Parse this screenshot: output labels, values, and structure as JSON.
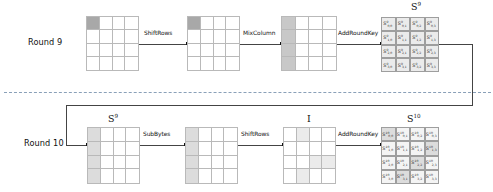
{
  "diagram": {
    "rows": [
      {
        "id": "round9",
        "label": "Round 9",
        "operations": [
          "ShiftRows",
          "MixColumn",
          "AddRoundKey"
        ],
        "output_state_label": "S",
        "output_state_superscript": "9"
      },
      {
        "id": "round10",
        "label": "Round 10",
        "input_state_label": "S",
        "input_state_superscript": "9",
        "operations": [
          "SubBytes",
          "ShiftRows",
          "AddRoundKey"
        ],
        "intermediate_label": "I",
        "output_state_label": "S",
        "output_state_superscript": "10"
      }
    ],
    "colors": {
      "grid_line": "#b9b9b9",
      "cell_border": "#9e9e9e",
      "connector": "#444444",
      "separator": "#8aa0b8",
      "shade_dark": "#a8a8a8",
      "shade_mid": "#c8c8c8",
      "shade_light": "#dcdcdc",
      "shade_pale": "#ebebeb"
    },
    "grids": {
      "r9_input": {
        "shading": [
          "dark",
          "",
          "",
          "",
          "",
          "",
          "",
          "",
          "",
          "",
          "",
          "",
          "",
          "",
          "",
          ""
        ]
      },
      "r9_shifted": {
        "shading": [
          "dark",
          "",
          "",
          "",
          "",
          "",
          "",
          "",
          "",
          "",
          "",
          "",
          "",
          "",
          "",
          ""
        ]
      },
      "r9_mixed": {
        "shading": [
          "mid",
          "",
          "",
          "",
          "mid",
          "",
          "",
          "",
          "mid",
          "",
          "",
          "",
          "mid",
          "",
          "",
          ""
        ]
      },
      "r10_input": {
        "shading": [
          "light",
          "",
          "",
          "",
          "light",
          "",
          "",
          "",
          "light",
          "",
          "",
          "",
          "light",
          "",
          "",
          ""
        ]
      },
      "r10_subbytes": {
        "shading": [
          "light",
          "",
          "",
          "",
          "light",
          "",
          "",
          "",
          "light",
          "",
          "",
          "",
          "light",
          "",
          "",
          ""
        ]
      },
      "r10_shiftrows_I": {
        "shading": [
          "",
          "pale",
          "",
          "",
          "",
          "",
          "",
          "",
          "",
          "",
          "pale",
          "pale",
          "",
          "pale",
          "",
          ""
        ]
      }
    },
    "state_s9": {
      "heading_base": "S",
      "heading_sup": "9",
      "cells": [
        {
          "base": "S",
          "sup": "9",
          "sub": "0,0"
        },
        {
          "base": "S",
          "sup": "9",
          "sub": "0,1"
        },
        {
          "base": "S",
          "sup": "9",
          "sub": "0,2"
        },
        {
          "base": "S",
          "sup": "9",
          "sub": "0,3"
        },
        {
          "base": "S",
          "sup": "9",
          "sub": "1,0"
        },
        {
          "base": "S",
          "sup": "9",
          "sub": "1,1"
        },
        {
          "base": "S",
          "sup": "9",
          "sub": "1,2"
        },
        {
          "base": "S",
          "sup": "9",
          "sub": "1,3"
        },
        {
          "base": "S",
          "sup": "9",
          "sub": "2,0"
        },
        {
          "base": "S",
          "sup": "9",
          "sub": "2,1"
        },
        {
          "base": "S",
          "sup": "9",
          "sub": "2,2"
        },
        {
          "base": "S",
          "sup": "9",
          "sub": "2,3"
        },
        {
          "base": "S",
          "sup": "9",
          "sub": "3,0"
        },
        {
          "base": "S",
          "sup": "9",
          "sub": "3,1"
        },
        {
          "base": "S",
          "sup": "9",
          "sub": "3,2"
        },
        {
          "base": "S",
          "sup": "9",
          "sub": "3,3"
        }
      ],
      "shading": [
        "pale",
        "pale",
        "pale",
        "pale",
        "pale",
        "pale",
        "pale",
        "pale",
        "pale",
        "pale",
        "pale",
        "pale",
        "pale",
        "pale",
        "pale",
        "pale"
      ]
    },
    "state_s10": {
      "heading_base": "S",
      "heading_sup": "10",
      "cells": [
        {
          "base": "S",
          "sup": "10",
          "sub": "0,0"
        },
        {
          "base": "S",
          "sup": "10",
          "sub": "0,1"
        },
        {
          "base": "S",
          "sup": "10",
          "sub": "0,2"
        },
        {
          "base": "S",
          "sup": "10",
          "sub": "0,3"
        },
        {
          "base": "S",
          "sup": "10",
          "sub": "1,0"
        },
        {
          "base": "S",
          "sup": "10",
          "sub": "1,1"
        },
        {
          "base": "S",
          "sup": "10",
          "sub": "1,2"
        },
        {
          "base": "S",
          "sup": "10",
          "sub": "1,3"
        },
        {
          "base": "S",
          "sup": "10",
          "sub": "2,0"
        },
        {
          "base": "S",
          "sup": "10",
          "sub": "2,1"
        },
        {
          "base": "S",
          "sup": "10",
          "sub": "2,2"
        },
        {
          "base": "S",
          "sup": "10",
          "sub": "2,3"
        },
        {
          "base": "S",
          "sup": "10",
          "sub": "3,0"
        },
        {
          "base": "S",
          "sup": "10",
          "sub": "3,1"
        },
        {
          "base": "S",
          "sup": "10",
          "sub": "3,2"
        },
        {
          "base": "S",
          "sup": "10",
          "sub": "3,3"
        }
      ],
      "shading": [
        "light",
        "",
        "",
        "",
        "",
        "",
        "",
        "light",
        "",
        "",
        "light",
        "",
        "",
        "light",
        "",
        ""
      ]
    }
  }
}
